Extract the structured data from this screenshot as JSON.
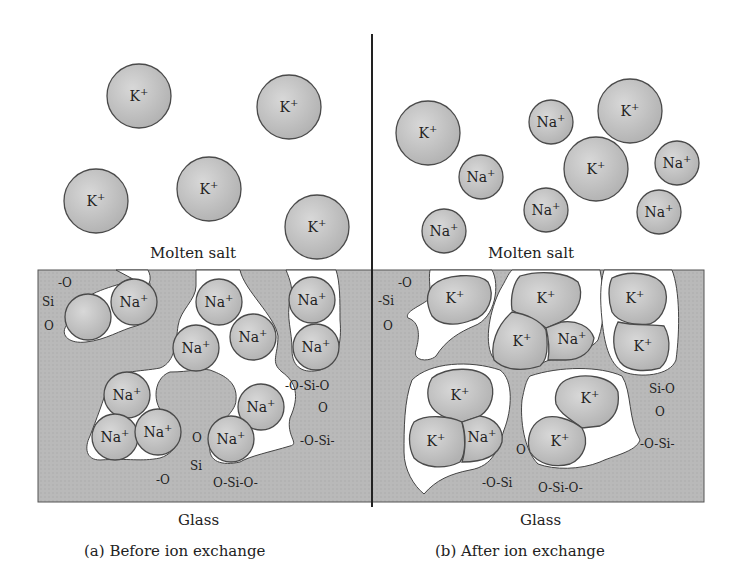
{
  "colors": {
    "glass": "#b8b8b8",
    "ion_fill": "#c4c4c4",
    "ion_stroke": "#4a4a4a",
    "pore": "#ffffff",
    "divider": "#222222"
  },
  "panels": [
    {
      "id": "a",
      "caption": "(a) Before ion exchange",
      "salt_label": "Molten salt",
      "glass_label": "Glass",
      "salt_ions": [
        {
          "symbol": "K",
          "charge": "+",
          "cx": 139,
          "cy": 96,
          "r": 32
        },
        {
          "symbol": "K",
          "charge": "+",
          "cx": 289,
          "cy": 107,
          "r": 32
        },
        {
          "symbol": "K",
          "charge": "+",
          "cx": 96,
          "cy": 201,
          "r": 32
        },
        {
          "symbol": "K",
          "charge": "+",
          "cx": 209,
          "cy": 189,
          "r": 32
        },
        {
          "symbol": "K",
          "charge": "+",
          "cx": 317,
          "cy": 227,
          "r": 32
        }
      ],
      "glass_ions": [
        {
          "symbol": "",
          "charge": "",
          "cx": 88,
          "cy": 317,
          "r": 23
        },
        {
          "symbol": "Na",
          "charge": "+",
          "cx": 134,
          "cy": 302,
          "r": 23
        },
        {
          "symbol": "Na",
          "charge": "+",
          "cx": 219,
          "cy": 302,
          "r": 23
        },
        {
          "symbol": "Na",
          "charge": "+",
          "cx": 196,
          "cy": 348,
          "r": 23
        },
        {
          "symbol": "Na",
          "charge": "+",
          "cx": 253,
          "cy": 337,
          "r": 23
        },
        {
          "symbol": "Na",
          "charge": "+",
          "cx": 312,
          "cy": 300,
          "r": 23
        },
        {
          "symbol": "Na",
          "charge": "+",
          "cx": 316,
          "cy": 347,
          "r": 23
        },
        {
          "symbol": "Na",
          "charge": "+",
          "cx": 127,
          "cy": 395,
          "r": 23
        },
        {
          "symbol": "Na",
          "charge": "+",
          "cx": 115,
          "cy": 437,
          "r": 23
        },
        {
          "symbol": "Na",
          "charge": "+",
          "cx": 158,
          "cy": 432,
          "r": 23
        },
        {
          "symbol": "Na",
          "charge": "+",
          "cx": 261,
          "cy": 407,
          "r": 23
        },
        {
          "symbol": "Na",
          "charge": "+",
          "cx": 231,
          "cy": 439,
          "r": 23
        }
      ],
      "silicate_labels": [
        {
          "text": "-O",
          "x": 58,
          "y": 287
        },
        {
          "text": "Si",
          "x": 42,
          "y": 306
        },
        {
          "text": "O",
          "x": 44,
          "y": 330
        },
        {
          "text": "-O-Si-O",
          "x": 285,
          "y": 390
        },
        {
          "text": "O",
          "x": 318,
          "y": 412
        },
        {
          "text": "-O-Si-",
          "x": 300,
          "y": 445
        },
        {
          "text": "O",
          "x": 192,
          "y": 442
        },
        {
          "text": "-O",
          "x": 156,
          "y": 484
        },
        {
          "text": "Si",
          "x": 190,
          "y": 470
        },
        {
          "text": "O-Si-O-",
          "x": 213,
          "y": 487
        }
      ]
    },
    {
      "id": "b",
      "caption": "(b) After ion exchange",
      "salt_label": "Molten salt",
      "glass_label": "Glass",
      "salt_ions": [
        {
          "symbol": "K",
          "charge": "+",
          "cx": 428,
          "cy": 133,
          "r": 32
        },
        {
          "symbol": "Na",
          "charge": "+",
          "cx": 481,
          "cy": 177,
          "r": 22
        },
        {
          "symbol": "Na",
          "charge": "+",
          "cx": 444,
          "cy": 231,
          "r": 22
        },
        {
          "symbol": "Na",
          "charge": "+",
          "cx": 551,
          "cy": 122,
          "r": 22
        },
        {
          "symbol": "K",
          "charge": "+",
          "cx": 630,
          "cy": 111,
          "r": 32
        },
        {
          "symbol": "K",
          "charge": "+",
          "cx": 596,
          "cy": 169,
          "r": 32
        },
        {
          "symbol": "Na",
          "charge": "+",
          "cx": 546,
          "cy": 210,
          "r": 22
        },
        {
          "symbol": "Na",
          "charge": "+",
          "cx": 677,
          "cy": 163,
          "r": 22
        },
        {
          "symbol": "Na",
          "charge": "+",
          "cx": 659,
          "cy": 212,
          "r": 22
        }
      ],
      "glass_ions": [
        {
          "symbol": "K",
          "charge": "+",
          "label_x": 455,
          "label_y": 300
        },
        {
          "symbol": "K",
          "charge": "+",
          "label_x": 546,
          "label_y": 300
        },
        {
          "symbol": "K",
          "charge": "+",
          "label_x": 522,
          "label_y": 343
        },
        {
          "symbol": "Na",
          "charge": "+",
          "label_x": 575,
          "label_y": 338
        },
        {
          "symbol": "K",
          "charge": "+",
          "label_x": 635,
          "label_y": 300
        },
        {
          "symbol": "K",
          "charge": "+",
          "label_x": 648,
          "label_y": 348
        },
        {
          "symbol": "K",
          "charge": "+",
          "label_x": 463,
          "label_y": 397
        },
        {
          "symbol": "K",
          "charge": "+",
          "label_x": 437,
          "label_y": 443
        },
        {
          "symbol": "Na",
          "charge": "+",
          "label_x": 481,
          "label_y": 437
        },
        {
          "symbol": "K",
          "charge": "+",
          "label_x": 594,
          "label_y": 400
        },
        {
          "symbol": "K",
          "charge": "+",
          "label_x": 565,
          "label_y": 440
        }
      ],
      "silicate_labels": [
        {
          "text": "-O",
          "x": 398,
          "y": 287
        },
        {
          "text": "-Si",
          "x": 378,
          "y": 305
        },
        {
          "text": "O",
          "x": 383,
          "y": 330
        },
        {
          "text": "Si-O",
          "x": 649,
          "y": 393
        },
        {
          "text": "O",
          "x": 655,
          "y": 416
        },
        {
          "text": "-O-Si-",
          "x": 640,
          "y": 448
        },
        {
          "text": "O",
          "x": 516,
          "y": 454
        },
        {
          "text": "-O-Si",
          "x": 482,
          "y": 487
        },
        {
          "text": "O-Si-O-",
          "x": 538,
          "y": 492
        }
      ]
    }
  ]
}
